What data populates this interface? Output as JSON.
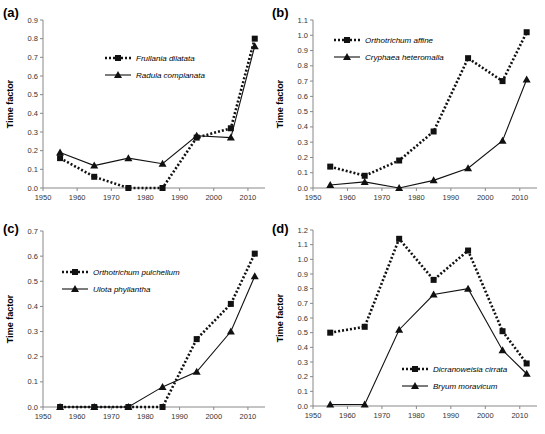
{
  "chart_data": [
    {
      "panel": "(a)",
      "type": "line",
      "xlabel": "",
      "ylabel": "Time factor",
      "x": [
        1955,
        1965,
        1975,
        1985,
        1995,
        2005,
        2012
      ],
      "xticks": [
        1950,
        1960,
        1970,
        1980,
        1990,
        2000,
        2010
      ],
      "xlim": [
        1950,
        2015
      ],
      "yticks": [
        0.0,
        0.1,
        0.2,
        0.3,
        0.4,
        0.5,
        0.6,
        0.7,
        0.8,
        0.9
      ],
      "ylim": [
        0,
        0.9
      ],
      "legend_position": "upper-center",
      "series": [
        {
          "name": "Frullania dilatata",
          "style": "dotted",
          "marker": "square",
          "values": [
            0.16,
            0.06,
            0.0,
            0.0,
            0.27,
            0.32,
            0.8
          ]
        },
        {
          "name": "Radula complanata",
          "style": "solid",
          "marker": "triangle",
          "values": [
            0.19,
            0.12,
            0.16,
            0.13,
            0.28,
            0.27,
            0.76
          ]
        }
      ]
    },
    {
      "panel": "(b)",
      "type": "line",
      "xlabel": "",
      "ylabel": "Time factor",
      "x": [
        1955,
        1965,
        1975,
        1985,
        1995,
        2005,
        2012
      ],
      "xticks": [
        1950,
        1960,
        1970,
        1980,
        1990,
        2000,
        2010
      ],
      "xlim": [
        1950,
        2015
      ],
      "yticks": [
        0.0,
        0.1,
        0.2,
        0.3,
        0.4,
        0.5,
        0.6,
        0.7,
        0.8,
        0.9,
        1.0,
        1.1
      ],
      "ylim": [
        0,
        1.1
      ],
      "legend_position": "upper-left",
      "series": [
        {
          "name": "Orthotrichum affine",
          "style": "dotted",
          "marker": "square",
          "values": [
            0.14,
            0.08,
            0.18,
            0.37,
            0.85,
            0.7,
            1.02
          ]
        },
        {
          "name": "Cryphaea heteromalla",
          "style": "solid",
          "marker": "triangle",
          "values": [
            0.02,
            0.04,
            0.0,
            0.05,
            0.13,
            0.31,
            0.71
          ]
        }
      ]
    },
    {
      "panel": "(c)",
      "type": "line",
      "xlabel": "",
      "ylabel": "Time factor",
      "x": [
        1955,
        1965,
        1975,
        1985,
        1995,
        2005,
        2012
      ],
      "xticks": [
        1950,
        1960,
        1970,
        1980,
        1990,
        2000,
        2010
      ],
      "xlim": [
        1950,
        2015
      ],
      "yticks": [
        0.0,
        0.1,
        0.2,
        0.3,
        0.4,
        0.5,
        0.6,
        0.7
      ],
      "ylim": [
        0,
        0.7
      ],
      "legend_position": "upper-left",
      "series": [
        {
          "name": "Orthotrichum pulchellum",
          "style": "dotted",
          "marker": "square",
          "values": [
            0.0,
            0.0,
            0.0,
            0.0,
            0.27,
            0.41,
            0.61
          ]
        },
        {
          "name": "Ulota phyllantha",
          "style": "solid",
          "marker": "triangle",
          "values": [
            0.0,
            0.0,
            0.0,
            0.08,
            0.14,
            0.3,
            0.52
          ]
        }
      ]
    },
    {
      "panel": "(d)",
      "type": "line",
      "xlabel": "",
      "ylabel": "Time factor",
      "x": [
        1955,
        1965,
        1975,
        1985,
        1995,
        2005,
        2012
      ],
      "xticks": [
        1950,
        1960,
        1970,
        1980,
        1990,
        2000,
        2010
      ],
      "xlim": [
        1950,
        2015
      ],
      "yticks": [
        0.0,
        0.1,
        0.2,
        0.3,
        0.4,
        0.5,
        0.6,
        0.7,
        0.8,
        0.9,
        1.0,
        1.1,
        1.2
      ],
      "ylim": [
        0,
        1.2
      ],
      "legend_position": "lower-center",
      "series": [
        {
          "name": "Dicranoweisia cirrata",
          "style": "dotted",
          "marker": "square",
          "values": [
            0.5,
            0.54,
            1.14,
            0.86,
            1.06,
            0.51,
            0.29
          ]
        },
        {
          "name": "Bryum moravicum",
          "style": "solid",
          "marker": "triangle",
          "values": [
            0.01,
            0.01,
            0.52,
            0.76,
            0.8,
            0.38,
            0.22
          ]
        }
      ]
    }
  ],
  "layout": [
    {
      "x0": 43,
      "x1": 265,
      "y0": 188,
      "y1": 20,
      "label_x": 3,
      "label_y": 17,
      "ylabel_x": 13,
      "legend_x": 105,
      "legend_y": 58
    },
    {
      "x0": 313,
      "x1": 537,
      "y0": 188,
      "y1": 20,
      "label_x": 272,
      "label_y": 17,
      "ylabel_x": 283,
      "legend_x": 334,
      "legend_y": 40
    },
    {
      "x0": 43,
      "x1": 265,
      "y0": 407,
      "y1": 231,
      "label_x": 3,
      "label_y": 233,
      "ylabel_x": 13,
      "legend_x": 62,
      "legend_y": 272
    },
    {
      "x0": 313,
      "x1": 537,
      "y0": 406,
      "y1": 230,
      "label_x": 272,
      "label_y": 233,
      "ylabel_x": 283,
      "legend_x": 402,
      "legend_y": 369
    }
  ]
}
